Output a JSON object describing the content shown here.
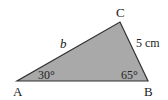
{
  "diagram": {
    "type": "triangle",
    "fill_color": "#a9a9a9",
    "stroke_color": "#333333",
    "vertices": {
      "A": {
        "label": "A",
        "x": 17,
        "y": 81
      },
      "B": {
        "label": "B",
        "x": 148,
        "y": 81
      },
      "C": {
        "label": "C",
        "x": 120,
        "y": 22
      }
    },
    "angles": {
      "A": "30°",
      "B": "65°"
    },
    "sides": {
      "AC": "b",
      "BC": "5 cm"
    }
  }
}
